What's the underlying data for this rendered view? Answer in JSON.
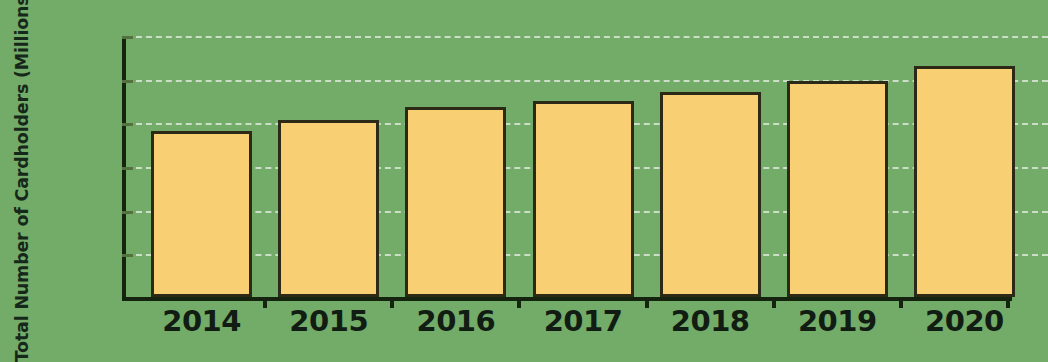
{
  "chart_data": {
    "type": "bar",
    "title": "",
    "subtitle": "",
    "xlabel": "",
    "ylabel": "Total Number of Cardholders (Millions)",
    "categories": [
      "2014",
      "2015",
      "2016",
      "2017",
      "2018",
      "2019",
      "2020"
    ],
    "values": [
      76,
      81,
      87,
      90,
      94,
      99,
      106
    ],
    "series": [
      {
        "name": "Total Number of Cardholders (Millions)",
        "values": [
          76,
          81,
          87,
          90,
          94,
          99,
          106
        ]
      }
    ],
    "ylim": [
      0,
      120
    ],
    "y_ticks": [
      0,
      20,
      40,
      60,
      80,
      100,
      120
    ],
    "y_tick_labels": [
      "0",
      "20",
      "40",
      "60",
      "80",
      "100",
      "120"
    ],
    "grid": true,
    "grid_axis": "y",
    "grid_style": "dashed",
    "legend": false,
    "legend_position": "none",
    "colors": {
      "background": "#73ab68",
      "bar_fill": "#f8cf73",
      "bar_edge": "#2c2a17",
      "axis": "#14240f",
      "gridline": "#ffffff",
      "text": "#111c13"
    }
  }
}
